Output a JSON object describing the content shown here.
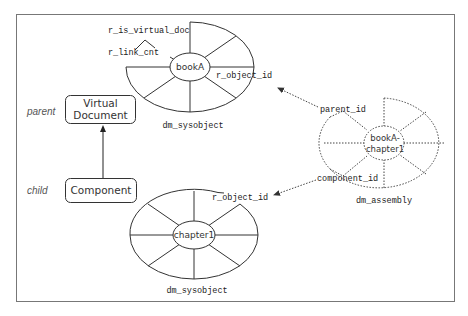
{
  "diagram": {
    "roles": {
      "parent": "parent",
      "child": "child"
    },
    "boxes": {
      "virtual_document": {
        "line1": "Virtual",
        "line2": "Document"
      },
      "component": "Component"
    },
    "top_object": {
      "center_label": "bookA",
      "caption": "dm_sysobject",
      "attributes": [
        "r_is_virtual_doc",
        "r_link_cnt",
        "r_object_id"
      ]
    },
    "bottom_object": {
      "center_label": "chapter1",
      "caption": "dm_sysobject",
      "attributes": [
        "r_object_id"
      ]
    },
    "assembly_object": {
      "center_line1": "bookA-",
      "center_line2": "chapter1",
      "caption": "dm_assembly",
      "attributes": [
        "parent_id",
        "component_id"
      ]
    },
    "relations": [
      {
        "from": "parent_id",
        "to": "bookA.r_object_id",
        "style": "dotted-arrow"
      },
      {
        "from": "component_id",
        "to": "chapter1.r_object_id",
        "style": "dotted-arrow"
      },
      {
        "from": "Component",
        "to": "Virtual Document",
        "style": "solid-arrow"
      }
    ]
  }
}
